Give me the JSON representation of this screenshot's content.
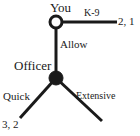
{
  "diagram": {
    "type": "extensive-form-game-tree",
    "nodes": [
      {
        "id": "root",
        "player_label": "You",
        "shape": "open-circle",
        "x": 56,
        "y": 22
      },
      {
        "id": "officer",
        "player_label": "Officer",
        "shape": "filled-circle",
        "x": 56,
        "y": 78
      }
    ],
    "edges": [
      {
        "id": "k9",
        "label": "K-9",
        "from": "root",
        "to_x": 117,
        "to_y": 22,
        "terminal": true,
        "payoff": "2, 1"
      },
      {
        "id": "allow",
        "label": "Allow",
        "from": "root",
        "to_x": 56,
        "to_y": 78,
        "terminal": false,
        "payoff": ""
      },
      {
        "id": "quick",
        "label": "Quick",
        "from": "officer",
        "to_x": 20,
        "to_y": 118,
        "terminal": true,
        "payoff": "3, 2"
      },
      {
        "id": "extensive",
        "label": "Extensive",
        "from": "officer",
        "to_x": 102,
        "to_y": 121,
        "terminal": true,
        "payoff": ""
      }
    ],
    "colors": {
      "line": "#1a1a1a",
      "text": "#1a1a1a",
      "node_fill_open": "#ffffff",
      "node_fill_closed": "#1a1a1a",
      "background": "#ffffff"
    }
  }
}
